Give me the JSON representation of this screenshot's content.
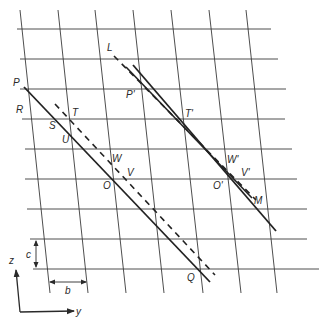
{
  "figure": {
    "colors": {
      "ink": "#2a2a2a",
      "grid": "#3a3a3a",
      "background": "#ffffff"
    }
  },
  "labels": {
    "P": "P",
    "R": "R",
    "S": "S",
    "T": "T",
    "U": "U",
    "W": "W",
    "V": "V",
    "O": "O",
    "Q": "Q",
    "L": "L",
    "P_prime": "P'",
    "T_prime": "T'",
    "W_prime": "W'",
    "V_prime": "V'",
    "O_prime": "O'",
    "M": "M",
    "b": "b",
    "c": "c",
    "z_axis": "z",
    "y_axis": "y"
  },
  "grid": {
    "horizontal_lines": [
      {
        "y": 29,
        "x1": 17,
        "x2": 271
      },
      {
        "y": 59,
        "x1": 20,
        "x2": 278
      },
      {
        "y": 89,
        "x1": 20,
        "x2": 286
      },
      {
        "y": 119,
        "x1": 22,
        "x2": 285
      },
      {
        "y": 149,
        "x1": 25,
        "x2": 292
      },
      {
        "y": 179,
        "x1": 25,
        "x2": 297
      },
      {
        "y": 209,
        "x1": 27,
        "x2": 307
      },
      {
        "y": 239,
        "x1": 30,
        "x2": 307
      },
      {
        "y": 269,
        "x1": 33,
        "x2": 319
      }
    ],
    "vertical_lines": [
      {
        "x1": 20,
        "y1": 10,
        "x2": 50,
        "y2": 293
      },
      {
        "x1": 58,
        "y1": 10,
        "x2": 88,
        "y2": 293
      },
      {
        "x1": 95,
        "y1": 10,
        "x2": 126,
        "y2": 293
      },
      {
        "x1": 133,
        "y1": 10,
        "x2": 164,
        "y2": 293
      },
      {
        "x1": 171,
        "y1": 10,
        "x2": 203,
        "y2": 293
      },
      {
        "x1": 209,
        "y1": 10,
        "x2": 241,
        "y2": 293
      },
      {
        "x1": 246,
        "y1": 10,
        "x2": 277,
        "y2": 293
      }
    ]
  }
}
